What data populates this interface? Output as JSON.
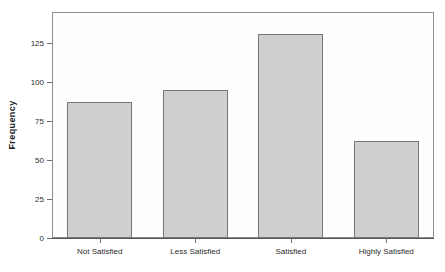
{
  "chart_data": {
    "type": "bar",
    "title": "",
    "subtitle": "",
    "xlabel": "",
    "ylabel": "Frequency",
    "categories": [
      "Not Satisfied",
      "Less Satisfied",
      "Satisfied",
      "Highly Satisfied"
    ],
    "values": [
      87,
      95,
      131,
      62
    ],
    "ylim": [
      0,
      145
    ],
    "yticks": [
      0,
      25,
      50,
      75,
      100,
      125
    ],
    "ytick_labels": [
      "0",
      "25",
      "50",
      "75",
      "100",
      "125"
    ],
    "grid": false,
    "legend": null,
    "legend_position": "none",
    "bar_fill_color": "#cfcfcf",
    "bar_border_color": "#777777",
    "plot_frame_color": "#8d8d8d",
    "background_color": "#ffffff",
    "axis_text_color": "#2b2b2b"
  }
}
